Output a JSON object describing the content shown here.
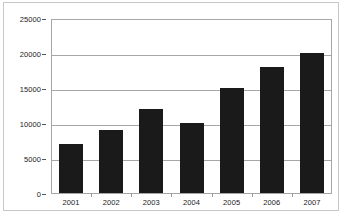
{
  "chart_data": {
    "type": "bar",
    "title": "",
    "title_note": "title row is cropped off the top edge of the screenshot",
    "xlabel": "",
    "ylabel": "",
    "categories": [
      "2001",
      "2002",
      "2003",
      "2004",
      "2005",
      "2006",
      "2007"
    ],
    "values": [
      7000,
      9000,
      12000,
      10000,
      15000,
      18000,
      20000
    ],
    "series": [
      {
        "name": "",
        "values": [
          7000,
          9000,
          12000,
          10000,
          15000,
          18000,
          20000
        ]
      }
    ],
    "ylim": [
      0,
      25000
    ],
    "ytick_labels": [
      "0",
      "5000",
      "10000",
      "15000",
      "20000",
      "25000"
    ],
    "ytick_values": [
      0,
      5000,
      10000,
      15000,
      20000,
      25000
    ],
    "grid": true,
    "grid_axis": "y",
    "legend": false,
    "legend_position": "none",
    "bar_color": "#1a1a1a",
    "plot_background": "#ffffff",
    "axis_color": "#a6a6a6",
    "frame_color": "#c8c8c8"
  }
}
